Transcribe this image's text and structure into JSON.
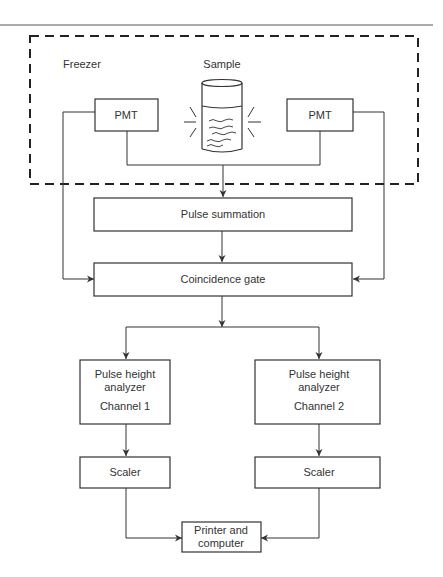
{
  "labels": {
    "freezer": "Freezer",
    "sample": "Sample"
  },
  "nodes": {
    "pmt_left": "PMT",
    "pmt_right": "PMT",
    "pulse_summation": "Pulse summation",
    "coincidence_gate": "Coincidence gate",
    "pha1_line1": "Pulse height",
    "pha1_line2": "analyzer",
    "pha1_channel": "Channel 1",
    "pha2_line1": "Pulse height",
    "pha2_line2": "analyzer",
    "pha2_channel": "Channel 2",
    "scaler_left": "Scaler",
    "scaler_right": "Scaler",
    "output_line1": "Printer and",
    "output_line2": "computer"
  },
  "colors": {
    "stroke": "#333333",
    "text": "#333333"
  }
}
